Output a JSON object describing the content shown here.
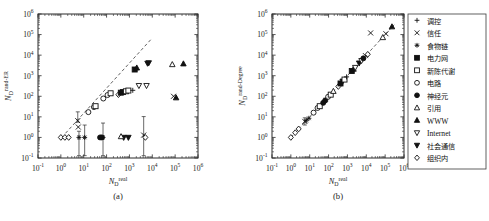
{
  "figure": {
    "panel_a_caption": "(a)",
    "panel_b_caption": "(b)",
    "xlabel_base": "N",
    "xlabel_sub": "D",
    "xlabel_sup": "real",
    "ylabel_a_sup": "rand-ER",
    "ylabel_b_sup": "rand-Degree",
    "tick_mantissa": "10",
    "xticks": [
      "-1",
      "0",
      "1",
      "2",
      "3",
      "4",
      "5",
      "6"
    ],
    "yticks": [
      "-1",
      "0",
      "1",
      "2",
      "3",
      "4",
      "5",
      "6"
    ]
  },
  "legend": {
    "items": [
      {
        "label": "调控",
        "marker": "plus",
        "script": "han"
      },
      {
        "label": "信任",
        "marker": "cross",
        "script": "han"
      },
      {
        "label": "食物链",
        "marker": "asterisk",
        "script": "han"
      },
      {
        "label": "电力网",
        "marker": "square-filled",
        "script": "han"
      },
      {
        "label": "新陈代谢",
        "marker": "square-open",
        "script": "han"
      },
      {
        "label": "电路",
        "marker": "circle-open",
        "script": "han"
      },
      {
        "label": "神经元",
        "marker": "circle-filled",
        "script": "han"
      },
      {
        "label": "引用",
        "marker": "triangle-open",
        "script": "han"
      },
      {
        "label": "WWW",
        "marker": "triangle-filled",
        "script": "latin"
      },
      {
        "label": "Internet",
        "marker": "dtriangle-open",
        "script": "latin"
      },
      {
        "label": "社会通信",
        "marker": "dtriangle-filled",
        "script": "han"
      },
      {
        "label": "组织内",
        "marker": "diamond-open",
        "script": "han"
      }
    ]
  },
  "colors": {
    "ink": "#111111",
    "frame": "#2b2b2b",
    "paper": "#ffffff"
  },
  "chart_data": [
    {
      "type": "scatter",
      "panel": "(a)",
      "title": "",
      "xlabel": "N_D^real",
      "ylabel": "N_D^rand-ER",
      "xscale": "log",
      "yscale": "log",
      "xlim": [
        0.1,
        1000000
      ],
      "ylim": [
        0.1,
        1000000
      ],
      "grid": false,
      "legend_position": "outside-right",
      "reference_line": {
        "type": "identity",
        "style": "dashed",
        "x": [
          1.6,
          9000
        ],
        "y": [
          1.6,
          60000
        ]
      },
      "points": [
        {
          "series": "组织内",
          "marker": "diamond-open",
          "x": 1.0,
          "y": 1.0
        },
        {
          "series": "组织内",
          "marker": "diamond-open",
          "x": 1.5,
          "y": 1.0
        },
        {
          "series": "组织内",
          "marker": "diamond-open",
          "x": 2.2,
          "y": 1.0
        },
        {
          "series": "信任",
          "marker": "cross",
          "x": 5.5,
          "y": 6.5,
          "yerr_lo": 1.0,
          "yerr_hi": 11.0
        },
        {
          "series": "信任",
          "marker": "cross",
          "x": 5.8,
          "y": 3.2
        },
        {
          "series": "食物链",
          "marker": "asterisk",
          "x": 6.2,
          "y": 1.0,
          "yerr_lo": 1.0,
          "yerr_hi": 1.0
        },
        {
          "series": "食物链",
          "marker": "asterisk",
          "x": 11.0,
          "y": 1.0,
          "yerr_lo": 1.0,
          "yerr_hi": 3.0
        },
        {
          "series": "电路",
          "marker": "circle-open",
          "x": 16.0,
          "y": 17.0
        },
        {
          "series": "电路",
          "marker": "circle-open",
          "x": 28.0,
          "y": 30.0
        },
        {
          "series": "新陈代谢",
          "marker": "square-open",
          "x": 33.0,
          "y": 33.0
        },
        {
          "series": "神经元",
          "marker": "circle-filled",
          "x": 52.0,
          "y": 1.0
        },
        {
          "series": "神经元",
          "marker": "circle-filled",
          "x": 62.0,
          "y": 1.0
        },
        {
          "series": "食物链",
          "marker": "asterisk",
          "x": 70.0,
          "y": 1.0,
          "yerr_lo": 1.0,
          "yerr_hi": 4.0
        },
        {
          "series": "电路",
          "marker": "circle-open",
          "x": 72.0,
          "y": 78.0
        },
        {
          "series": "电路",
          "marker": "circle-open",
          "x": 110.0,
          "y": 115.0
        },
        {
          "series": "新陈代谢",
          "marker": "square-open",
          "x": 150.0,
          "y": 140.0
        },
        {
          "series": "组织内",
          "marker": "diamond-open",
          "x": 330.0,
          "y": 120.0
        },
        {
          "series": "电力网",
          "marker": "square-filled",
          "x": 420.0,
          "y": 150.0
        },
        {
          "series": "电力网",
          "marker": "square-filled",
          "x": 520.0,
          "y": 160.0
        },
        {
          "series": "新陈代谢",
          "marker": "square-open",
          "x": 700.0,
          "y": 175.0
        },
        {
          "series": "新陈代谢",
          "marker": "square-open",
          "x": 900.0,
          "y": 190.0
        },
        {
          "series": "调控",
          "marker": "plus",
          "x": 1400.0,
          "y": 195.0
        },
        {
          "series": "社会通信",
          "marker": "dtriangle-filled",
          "x": 560.0,
          "y": 1.0
        },
        {
          "series": "社会通信",
          "marker": "dtriangle-filled",
          "x": 900.0,
          "y": 1.0
        },
        {
          "series": "引用",
          "marker": "triangle-open",
          "x": 430.0,
          "y": 1.1
        },
        {
          "series": "电力网",
          "marker": "square-filled",
          "x": 1700.0,
          "y": 2000.0
        },
        {
          "series": "WWW",
          "marker": "triangle-filled",
          "x": 2100.0,
          "y": 2400.0
        },
        {
          "series": "Internet",
          "marker": "dtriangle-open",
          "x": 2600.0,
          "y": 330.0
        },
        {
          "series": "Internet",
          "marker": "dtriangle-open",
          "x": 5600.0,
          "y": 330.0
        },
        {
          "series": "社会通信",
          "marker": "dtriangle-filled",
          "x": 6200.0,
          "y": 4000.0
        },
        {
          "series": "社会通信",
          "marker": "dtriangle-filled",
          "x": 7000.0,
          "y": 4200.0
        },
        {
          "series": "信任",
          "marker": "cross",
          "x": 4200.0,
          "y": 1.3,
          "yerr_lo": 1.3,
          "yerr_hi": 9.0
        },
        {
          "series": "组织内",
          "marker": "diamond-open",
          "x": 5000.0,
          "y": 1.0
        },
        {
          "series": "信任",
          "marker": "cross",
          "x": 85000.0,
          "y": 100.0
        },
        {
          "series": "WWW",
          "marker": "triangle-filled",
          "x": 110000.0,
          "y": 85.0
        },
        {
          "series": "引用",
          "marker": "triangle-open",
          "x": 75000.0,
          "y": 3500.0
        },
        {
          "series": "WWW",
          "marker": "triangle-filled",
          "x": 230000.0,
          "y": 3800.0
        }
      ]
    },
    {
      "type": "scatter",
      "panel": "(b)",
      "title": "",
      "xlabel": "N_D^real",
      "ylabel": "N_D^rand-Degree",
      "xscale": "log",
      "yscale": "log",
      "xlim": [
        0.1,
        1000000
      ],
      "ylim": [
        0.1,
        1000000
      ],
      "grid": false,
      "legend_position": "outside-right",
      "reference_line": {
        "type": "identity",
        "style": "dashed",
        "x": [
          1.0,
          300000
        ],
        "y": [
          1.0,
          300000
        ]
      },
      "points": [
        {
          "series": "组织内",
          "marker": "diamond-open",
          "x": 1.0,
          "y": 1.0
        },
        {
          "series": "组织内",
          "marker": "diamond-open",
          "x": 1.7,
          "y": 1.7
        },
        {
          "series": "组织内",
          "marker": "diamond-open",
          "x": 2.6,
          "y": 2.6
        },
        {
          "series": "信任",
          "marker": "cross",
          "x": 5.5,
          "y": 6.0,
          "yerr_lo": 2.0,
          "yerr_hi": 3.0
        },
        {
          "series": "食物链",
          "marker": "asterisk",
          "x": 6.5,
          "y": 6.5
        },
        {
          "series": "食物链",
          "marker": "asterisk",
          "x": 9.0,
          "y": 8.5
        },
        {
          "series": "电路",
          "marker": "circle-open",
          "x": 16.0,
          "y": 16.0
        },
        {
          "series": "电路",
          "marker": "circle-open",
          "x": 26.0,
          "y": 27.0
        },
        {
          "series": "新陈代谢",
          "marker": "square-open",
          "x": 34.0,
          "y": 33.0
        },
        {
          "series": "神经元",
          "marker": "circle-filled",
          "x": 52.0,
          "y": 48.0
        },
        {
          "series": "神经元",
          "marker": "circle-filled",
          "x": 66.0,
          "y": 62.0
        },
        {
          "series": "食物链",
          "marker": "asterisk",
          "x": 72.0,
          "y": 70.0
        },
        {
          "series": "电路",
          "marker": "circle-open",
          "x": 95.0,
          "y": 95.0
        },
        {
          "series": "新陈代谢",
          "marker": "square-open",
          "x": 130.0,
          "y": 120.0
        },
        {
          "series": "引用",
          "marker": "triangle-open",
          "x": 180.0,
          "y": 175.0
        },
        {
          "series": "组织内",
          "marker": "diamond-open",
          "x": 330.0,
          "y": 300.0
        },
        {
          "series": "电力网",
          "marker": "square-filled",
          "x": 430.0,
          "y": 420.0
        },
        {
          "series": "社会通信",
          "marker": "dtriangle-filled",
          "x": 560.0,
          "y": 540.0
        },
        {
          "series": "新陈代谢",
          "marker": "square-open",
          "x": 700.0,
          "y": 650.0
        },
        {
          "series": "调控",
          "marker": "plus",
          "x": 900.0,
          "y": 880.0
        },
        {
          "series": "电力网",
          "marker": "square-filled",
          "x": 1700.0,
          "y": 1700.0
        },
        {
          "series": "WWW",
          "marker": "triangle-filled",
          "x": 2100.0,
          "y": 2100.0
        },
        {
          "series": "Internet",
          "marker": "dtriangle-open",
          "x": 2600.0,
          "y": 2500.0
        },
        {
          "series": "社会通信",
          "marker": "dtriangle-filled",
          "x": 4200.0,
          "y": 4100.0
        },
        {
          "series": "Internet",
          "marker": "dtriangle-open",
          "x": 5600.0,
          "y": 5400.0
        },
        {
          "series": "神经元",
          "marker": "circle-filled",
          "x": 7000.0,
          "y": 7000.0
        },
        {
          "series": "信任",
          "marker": "cross",
          "x": 9000.0,
          "y": 9500.0
        },
        {
          "series": "组织内",
          "marker": "diamond-open",
          "x": 12000.0,
          "y": 11000.0
        },
        {
          "series": "信任",
          "marker": "cross",
          "x": 17000.0,
          "y": 120000.0
        },
        {
          "series": "引用",
          "marker": "triangle-open",
          "x": 75000.0,
          "y": 72000.0
        },
        {
          "series": "信任",
          "marker": "cross",
          "x": 110000.0,
          "y": 110000.0
        },
        {
          "series": "WWW",
          "marker": "triangle-filled",
          "x": 230000.0,
          "y": 240000.0
        }
      ]
    }
  ]
}
